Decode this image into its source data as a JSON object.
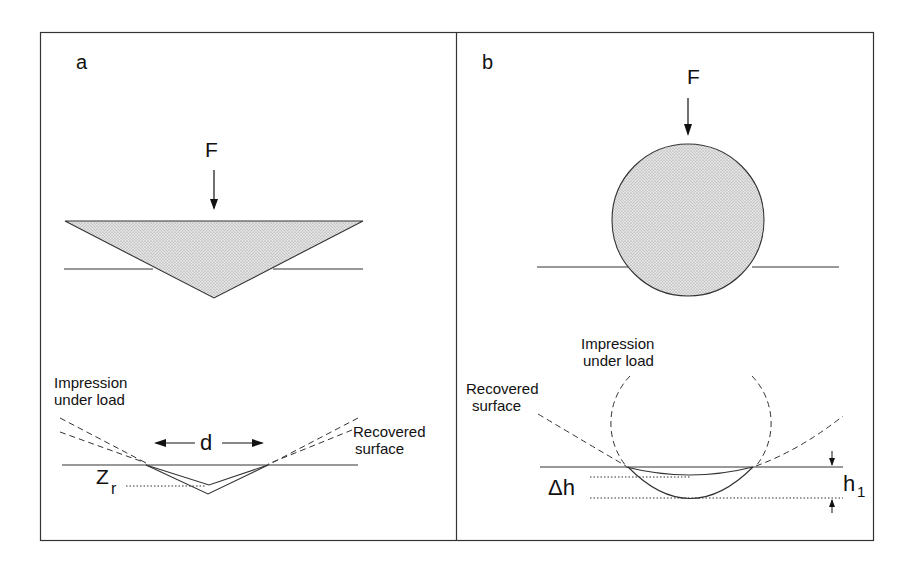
{
  "figure": {
    "panels": [
      {
        "id": "a",
        "label": "a",
        "indenter": "conical / pyramidal (triangle cross-section)",
        "force_label": "F",
        "impression_label_line1": "Impression",
        "impression_label_line2": "under load",
        "recovered_label_line1": "Recovered",
        "recovered_label_line2": "surface",
        "diameter_label": "d",
        "depth_label_main": "Z",
        "depth_label_sub": "r"
      },
      {
        "id": "b",
        "label": "b",
        "indenter": "spherical (circle cross-section)",
        "force_label": "F",
        "impression_label_line1": "Impression",
        "impression_label_line2": "under load",
        "recovered_label_line1": "Recovered",
        "recovered_label_line2": "surface",
        "delta_label": "Δh",
        "height_label_main": "h",
        "height_label_sub": "1"
      }
    ],
    "colors": {
      "line": "#222222",
      "fill_stipple": "#d6d6d6",
      "background": "#ffffff"
    }
  }
}
